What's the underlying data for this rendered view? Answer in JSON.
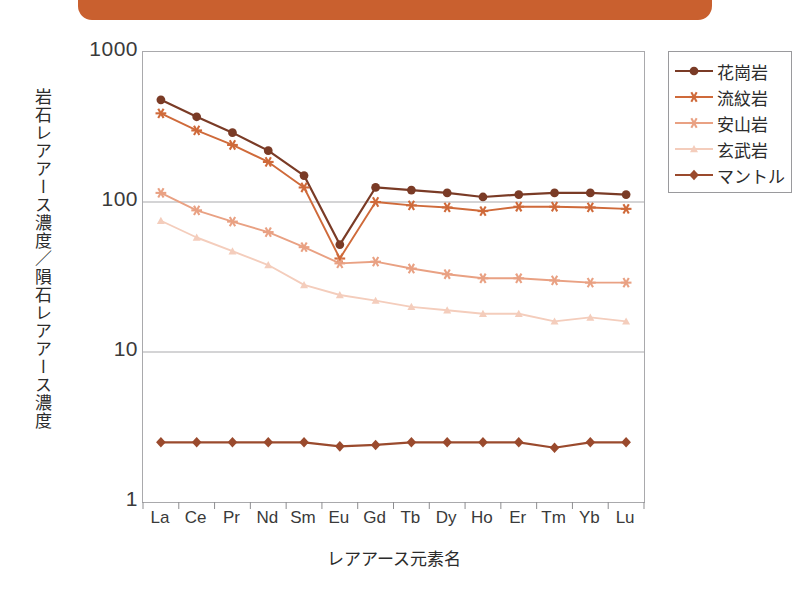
{
  "header": {
    "band_color": "#c9602f"
  },
  "chart_data": {
    "type": "line",
    "title": "",
    "xlabel": "レアアース元素名",
    "ylabel": "岩石レアアース濃度／隕石レアアース濃度",
    "categories": [
      "La",
      "Ce",
      "Pr",
      "Nd",
      "Sm",
      "Eu",
      "Gd",
      "Tb",
      "Dy",
      "Ho",
      "Er",
      "Tm",
      "Yb",
      "Lu"
    ],
    "log_y": true,
    "ylim": [
      1,
      1000
    ],
    "yticks": [
      1,
      10,
      100,
      1000
    ],
    "ytick_labels": [
      "1",
      "10",
      "100",
      "1000"
    ],
    "grid": "horizontal-major",
    "legend_position": "right-outside",
    "series": [
      {
        "name": "花崗岩",
        "color": "#7a3b26",
        "marker": "circle",
        "values": [
          480,
          370,
          290,
          220,
          150,
          52,
          125,
          120,
          115,
          108,
          112,
          115,
          115,
          112
        ]
      },
      {
        "name": "流紋岩",
        "color": "#cf6a3a",
        "marker": "star",
        "values": [
          390,
          300,
          240,
          185,
          125,
          42,
          100,
          95,
          92,
          87,
          93,
          93,
          92,
          90
        ]
      },
      {
        "name": "安山岩",
        "color": "#e9a183",
        "marker": "star",
        "values": [
          115,
          88,
          74,
          63,
          50,
          39,
          40,
          36,
          33,
          31,
          31,
          30,
          29,
          29
        ]
      },
      {
        "name": "玄武岩",
        "color": "#f4cdbc",
        "marker": "triangle",
        "values": [
          75,
          58,
          47,
          38,
          28,
          24,
          22,
          20,
          19,
          18,
          18,
          16,
          17,
          16
        ]
      },
      {
        "name": "マントル",
        "color": "#9a4a2d",
        "marker": "diamond",
        "values": [
          2.5,
          2.5,
          2.5,
          2.5,
          2.5,
          2.35,
          2.4,
          2.5,
          2.5,
          2.5,
          2.5,
          2.3,
          2.5,
          2.5
        ]
      }
    ]
  }
}
